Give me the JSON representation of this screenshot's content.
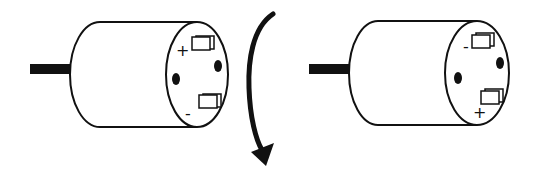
{
  "diagram": {
    "left_motor": {
      "top_terminal_label": "+",
      "bottom_terminal_label": "-"
    },
    "right_motor": {
      "top_terminal_label": "-",
      "bottom_terminal_label": "+"
    },
    "arrow": {
      "meaning": "rotation",
      "direction": "clockwise-down"
    },
    "colors": {
      "stroke": "#111111",
      "background": "#ffffff"
    }
  }
}
